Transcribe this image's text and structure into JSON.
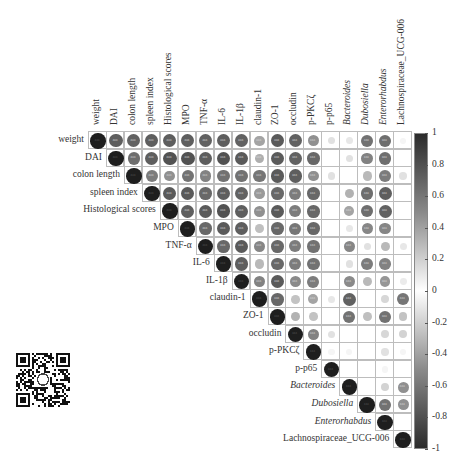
{
  "chart_data": {
    "type": "heatmap",
    "subtype": "correlation-matrix-upper-circles",
    "title": "",
    "variables": [
      {
        "name": "weight",
        "italic": false
      },
      {
        "name": "DAI",
        "italic": false
      },
      {
        "name": "colon length",
        "italic": false
      },
      {
        "name": "spleen index",
        "italic": false
      },
      {
        "name": "Histological scores",
        "italic": false
      },
      {
        "name": "MPO",
        "italic": false
      },
      {
        "name": "TNF-α",
        "italic": false
      },
      {
        "name": "IL-6",
        "italic": false
      },
      {
        "name": "IL-1β",
        "italic": false
      },
      {
        "name": "claudin-1",
        "italic": false
      },
      {
        "name": "ZO-1",
        "italic": false
      },
      {
        "name": "occludin",
        "italic": false
      },
      {
        "name": "p-PKCζ",
        "italic": false
      },
      {
        "name": "p-p65",
        "italic": false
      },
      {
        "name": "Bacteroides",
        "italic": true
      },
      {
        "name": "Dubosiella",
        "italic": true
      },
      {
        "name": "Enterorhabdus",
        "italic": true
      },
      {
        "name": "Lachnospiraceae_UCG-006",
        "italic": false
      }
    ],
    "matrix_upper": [
      [
        1.0,
        0.8,
        0.78,
        0.8,
        0.8,
        0.8,
        0.78,
        0.8,
        0.78,
        0.45,
        0.82,
        0.78,
        0.55,
        0.15,
        0.12,
        0.7,
        0.72,
        0.05
      ],
      [
        null,
        1.0,
        0.72,
        0.8,
        0.86,
        0.86,
        0.8,
        0.86,
        0.82,
        0.4,
        0.82,
        0.78,
        0.75,
        0.0,
        0.15,
        0.62,
        0.72,
        0.0
      ],
      [
        null,
        null,
        1.0,
        0.65,
        0.55,
        0.7,
        0.62,
        0.7,
        0.7,
        0.68,
        0.82,
        0.8,
        0.55,
        0.15,
        0.0,
        0.35,
        0.65,
        0.15
      ],
      [
        null,
        null,
        null,
        1.0,
        0.82,
        0.82,
        0.75,
        0.8,
        0.78,
        0.5,
        0.75,
        0.65,
        0.75,
        0.0,
        0.38,
        0.72,
        0.8,
        0.0
      ],
      [
        null,
        null,
        null,
        null,
        1.0,
        0.8,
        0.82,
        0.86,
        0.8,
        0.55,
        0.82,
        0.65,
        0.75,
        0.0,
        0.45,
        0.72,
        0.78,
        0.0
      ],
      [
        null,
        null,
        null,
        null,
        null,
        1.0,
        0.75,
        0.82,
        0.8,
        0.32,
        0.75,
        0.68,
        0.75,
        0.0,
        0.12,
        0.6,
        0.6,
        0.0
      ],
      [
        null,
        null,
        null,
        null,
        null,
        null,
        1.0,
        0.75,
        0.82,
        0.6,
        0.75,
        0.65,
        0.7,
        0.0,
        0.6,
        0.15,
        0.35,
        0.12
      ],
      [
        null,
        null,
        null,
        null,
        null,
        null,
        null,
        1.0,
        0.8,
        0.35,
        0.75,
        0.65,
        0.7,
        0.0,
        0.15,
        0.65,
        0.62,
        0.0
      ],
      [
        null,
        null,
        null,
        null,
        null,
        null,
        null,
        null,
        1.0,
        0.62,
        0.82,
        0.58,
        0.65,
        0.0,
        0.58,
        0.35,
        0.52,
        0.1
      ],
      [
        null,
        null,
        null,
        null,
        null,
        null,
        null,
        null,
        null,
        1.0,
        0.75,
        0.3,
        0.45,
        0.12,
        0.78,
        0.0,
        0.2,
        0.68
      ],
      [
        null,
        null,
        null,
        null,
        null,
        null,
        null,
        null,
        null,
        null,
        1.0,
        0.38,
        0.3,
        0.0,
        0.7,
        0.32,
        0.7,
        0.3
      ],
      [
        null,
        null,
        null,
        null,
        null,
        null,
        null,
        null,
        null,
        null,
        null,
        1.0,
        0.62,
        0.15,
        0.0,
        0.0,
        0.2,
        0.22
      ],
      [
        null,
        null,
        null,
        null,
        null,
        null,
        null,
        null,
        null,
        null,
        null,
        null,
        1.0,
        0.05,
        0.05,
        0.0,
        0.15,
        0.05
      ],
      [
        null,
        null,
        null,
        null,
        null,
        null,
        null,
        null,
        null,
        null,
        null,
        null,
        null,
        1.0,
        0.0,
        0.0,
        0.05,
        0.0
      ],
      [
        null,
        null,
        null,
        null,
        null,
        null,
        null,
        null,
        null,
        null,
        null,
        null,
        null,
        null,
        1.0,
        0.0,
        0.22,
        0.55
      ],
      [
        null,
        null,
        null,
        null,
        null,
        null,
        null,
        null,
        null,
        null,
        null,
        null,
        null,
        null,
        null,
        1.0,
        0.7,
        0.55
      ],
      [
        null,
        null,
        null,
        null,
        null,
        null,
        null,
        null,
        null,
        null,
        null,
        null,
        null,
        null,
        null,
        null,
        1.0,
        0.0
      ],
      [
        null,
        null,
        null,
        null,
        null,
        null,
        null,
        null,
        null,
        null,
        null,
        null,
        null,
        null,
        null,
        null,
        null,
        1.0
      ]
    ],
    "significance_marker": "***",
    "significance_threshold_abs": 0.4,
    "colorbar": {
      "min": -1,
      "max": 1,
      "ticks": [
        "1",
        "0.8",
        "0.6",
        "0.4",
        "0.2",
        "0",
        "-0.2",
        "-0.4",
        "-0.6",
        "-0.8",
        "-1"
      ],
      "position": "right"
    },
    "xlabel": "",
    "ylabel": "",
    "grid": true
  },
  "decor": {
    "qr_code": "qr-code-image"
  }
}
